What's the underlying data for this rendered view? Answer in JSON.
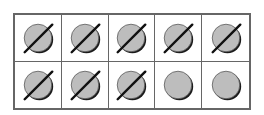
{
  "ten_frame": {
    "rows": 2,
    "columns": 5,
    "total_cells": 10,
    "counters_total": 10,
    "counters_crossed_out": 8,
    "counters_remaining": 2,
    "cells": [
      {
        "counter": "circle-icon",
        "crossed": true
      },
      {
        "counter": "circle-icon",
        "crossed": true
      },
      {
        "counter": "circle-icon",
        "crossed": true
      },
      {
        "counter": "circle-icon",
        "crossed": true
      },
      {
        "counter": "circle-icon",
        "crossed": true
      },
      {
        "counter": "circle-icon",
        "crossed": true
      },
      {
        "counter": "circle-icon",
        "crossed": true
      },
      {
        "counter": "circle-icon",
        "crossed": true
      },
      {
        "counter": "circle-icon",
        "crossed": false
      },
      {
        "counter": "circle-icon",
        "crossed": false
      }
    ],
    "colors": {
      "counter_fill": "#bdbdbd",
      "counter_shadow": "#1a1a1a",
      "grid_line": "#666666",
      "slash": "#111111"
    }
  }
}
